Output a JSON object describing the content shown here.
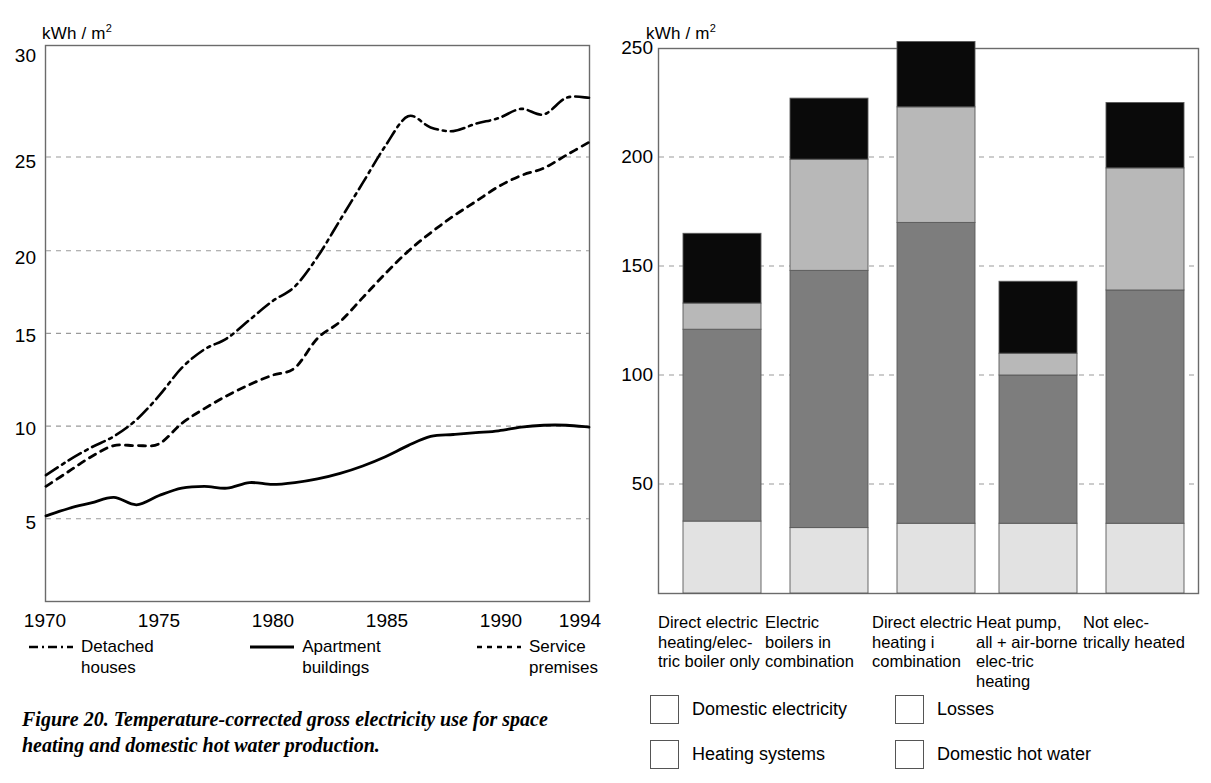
{
  "figure": {
    "caption": "Figure 20.  Temperature-corrected gross electricity use for space heating and domestic hot water production."
  },
  "colors": {
    "domestic_electricity": "#0a0a0a",
    "losses": "#b8b8b8",
    "heating_systems": "#7d7d7d",
    "domestic_hot_water": "#e2e2e2",
    "axis": "#6b6b6b",
    "grid": "#9a9a9a",
    "line": "#000000"
  },
  "left_chart": {
    "unit_label": "kWh / m",
    "unit_exponent": "2",
    "y_ticks": [
      "30",
      "25",
      "20",
      "15",
      "10",
      "5"
    ],
    "x_ticks": [
      "1970",
      "1975",
      "1980",
      "1985",
      "1990",
      "1994"
    ],
    "legend": [
      {
        "label_line1": "Detached",
        "label_line2": "houses",
        "style": "dash-dot"
      },
      {
        "label_line1": "Apartment",
        "label_line2": "buildings",
        "style": "solid"
      },
      {
        "label_line1": "Service",
        "label_line2": "premises",
        "style": "dotted"
      }
    ]
  },
  "right_chart": {
    "unit_label": "kWh / m",
    "unit_exponent": "2",
    "y_ticks": [
      "250",
      "200",
      "150",
      "100",
      "50"
    ],
    "categories": [
      "Direct electric heating/elec-tric boiler only",
      "Electric boilers in combination",
      "Direct electric heating i combination",
      "Heat pump, all + air-borne elec-tric heating",
      "Not elec-trically heated"
    ],
    "legend": [
      {
        "label": "Domestic electricity",
        "color_key": "domestic_electricity"
      },
      {
        "label": "Losses",
        "color_key": "losses"
      },
      {
        "label": "Heating systems",
        "color_key": "heating_systems"
      },
      {
        "label": "Domestic hot water",
        "color_key": "domestic_hot_water"
      }
    ]
  },
  "chart_data": [
    {
      "type": "line",
      "id": "left",
      "title": "",
      "xlabel": "",
      "ylabel": "kWh / m2",
      "xlim": [
        1970,
        1994
      ],
      "ylim": [
        0,
        30
      ],
      "grid": true,
      "legend_position": "below",
      "x": [
        1970,
        1971,
        1972,
        1973,
        1974,
        1975,
        1976,
        1977,
        1978,
        1979,
        1980,
        1981,
        1982,
        1983,
        1984,
        1985,
        1986,
        1987,
        1988,
        1989,
        1990,
        1991,
        1992,
        1993,
        1994
      ],
      "series": [
        {
          "name": "Detached houses",
          "style": "dash-dot",
          "values": [
            6.8,
            7.6,
            8.3,
            8.9,
            9.8,
            11.1,
            12.6,
            13.6,
            14.2,
            15.2,
            16.2,
            17.0,
            18.6,
            20.6,
            22.6,
            24.6,
            26.2,
            25.6,
            25.4,
            25.8,
            26.1,
            26.6,
            26.3,
            27.2,
            27.2
          ]
        },
        {
          "name": "Apartment buildings",
          "style": "solid",
          "values": [
            4.6,
            5.0,
            5.3,
            5.6,
            5.2,
            5.7,
            6.1,
            6.2,
            6.1,
            6.4,
            6.3,
            6.4,
            6.6,
            6.9,
            7.3,
            7.8,
            8.4,
            8.9,
            9.0,
            9.1,
            9.2,
            9.4,
            9.5,
            9.5,
            9.4
          ]
        },
        {
          "name": "Service premises",
          "style": "dotted",
          "values": [
            6.2,
            7.0,
            7.8,
            8.4,
            8.4,
            8.5,
            9.6,
            10.4,
            11.1,
            11.7,
            12.2,
            12.6,
            14.2,
            15.1,
            16.4,
            17.7,
            18.9,
            19.9,
            20.8,
            21.6,
            22.4,
            23.0,
            23.4,
            24.1,
            24.8
          ]
        }
      ]
    },
    {
      "type": "bar",
      "id": "right",
      "stacked": true,
      "title": "",
      "xlabel": "",
      "ylabel": "kWh / m2",
      "ylim": [
        0,
        250
      ],
      "grid": true,
      "legend_position": "below",
      "categories": [
        "Direct electric heating/electric boiler only",
        "Electric boilers in combination",
        "Direct electric heating i combination",
        "Heat pump, all + airborne electric heating",
        "Not electrically heated"
      ],
      "series": [
        {
          "name": "Domestic hot water",
          "values": [
            33,
            30,
            32,
            32,
            32
          ]
        },
        {
          "name": "Heating systems",
          "values": [
            88,
            118,
            138,
            68,
            107
          ]
        },
        {
          "name": "Losses",
          "values": [
            12,
            51,
            53,
            10,
            56
          ]
        },
        {
          "name": "Domestic electricity",
          "values": [
            32,
            28,
            30,
            33,
            30
          ]
        }
      ],
      "totals": [
        165,
        227,
        253,
        143,
        225
      ]
    }
  ]
}
